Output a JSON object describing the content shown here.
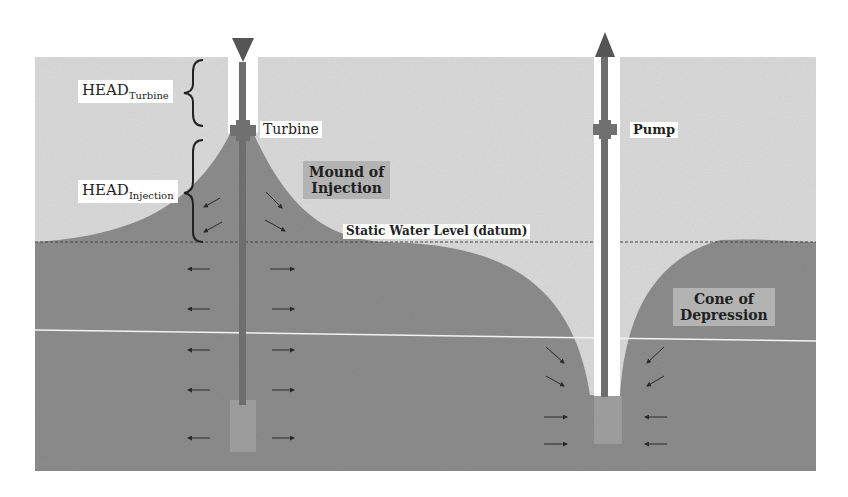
{
  "diagram": {
    "labels": {
      "head_turbine_main": "HEAD",
      "head_turbine_sub": "Turbine",
      "head_injection_main": "HEAD",
      "head_injection_sub": "Injection",
      "turbine": "Turbine",
      "pump": "Pump",
      "mound": "Mound of Injection",
      "mound_line1": "Mound of",
      "mound_line2": "Injection",
      "static_level": "Static Water Level (datum)",
      "cone_line1": "Cone of",
      "cone_line2": "Depression"
    },
    "colors": {
      "background": "#ffffff",
      "unsaturated_zone": "#d9d9d9",
      "saturated_zone": "#8c8c8c",
      "well_pipe": "#6e6e6e",
      "screen": "#9c9c9c",
      "arrow": "#2a2a2a",
      "label_box_dark": "#b3b3b3"
    },
    "wells": [
      {
        "name": "injection-well",
        "flow": "down",
        "device": "Turbine"
      },
      {
        "name": "pumping-well",
        "flow": "up",
        "device": "Pump"
      }
    ]
  }
}
